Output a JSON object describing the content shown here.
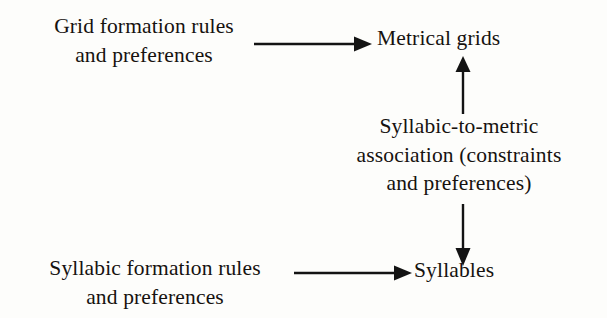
{
  "figure": {
    "type": "flow-diagram",
    "background_color": "#fdfdfb",
    "text_color": "#16120f",
    "arrow_color": "#131313"
  },
  "nodes": {
    "grid_rules": {
      "name": "grid-formation-rules",
      "lines": [
        "Grid formation rules",
        "and preferences"
      ]
    },
    "metrical_grids": {
      "name": "metrical-grids",
      "lines": [
        "Metrical grids"
      ]
    },
    "association": {
      "name": "syllabic-to-metric-association",
      "lines": [
        "Syllabic-to-metric",
        "association (constraints",
        "and preferences)"
      ]
    },
    "syllabic_rules": {
      "name": "syllabic-formation-rules",
      "lines": [
        "Syllabic formation rules",
        "and preferences"
      ]
    },
    "syllables": {
      "name": "syllables",
      "lines": [
        "Syllables"
      ]
    }
  },
  "arrows": [
    {
      "name": "grid-rules-to-metrical-grids",
      "from": "grid_rules",
      "to": "metrical_grids",
      "direction": "right"
    },
    {
      "name": "association-to-metrical-grids",
      "from": "association",
      "to": "metrical_grids",
      "direction": "up"
    },
    {
      "name": "association-to-syllables",
      "from": "association",
      "to": "syllables",
      "direction": "down"
    },
    {
      "name": "syllabic-rules-to-syllables",
      "from": "syllabic_rules",
      "to": "syllables",
      "direction": "right"
    }
  ]
}
